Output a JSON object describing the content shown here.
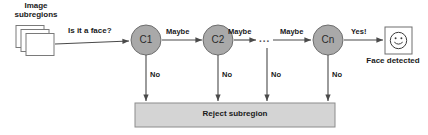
{
  "diagram": {
    "colors": {
      "node_fill": "#a9a9a9",
      "node_stroke": "#6e6e6e",
      "bar_fill": "#d4d4d4",
      "bar_stroke": "#8c8c8c",
      "stack_fill": "#ffffff",
      "stack_stroke": "#7a7a7a",
      "arrow": "#4a4a4a",
      "text": "#1a1a1a",
      "face_box_fill": "#ffffff",
      "face_box_stroke": "#6e6e6e"
    },
    "input": {
      "label_line1": "Image",
      "label_line2": "subregions",
      "icon": "stacked-rectangles-icon",
      "sheet_count": 3
    },
    "question_label": "Is it a face?",
    "stages": [
      {
        "id": "c1",
        "label": "C1",
        "pass_label": "Maybe",
        "reject_label": "No"
      },
      {
        "id": "c2",
        "label": "C2",
        "pass_label": "Maybe",
        "reject_label": "No"
      },
      {
        "id": "ellipsis",
        "label": "...",
        "pass_label": "Maybe",
        "reject_label": "No"
      },
      {
        "id": "cn",
        "label": "Cn",
        "pass_label": "Yes!",
        "reject_label": "No"
      }
    ],
    "reject": {
      "label": "Reject subregion"
    },
    "output": {
      "label": "Face detected",
      "icon": "smiley-face-icon"
    }
  }
}
